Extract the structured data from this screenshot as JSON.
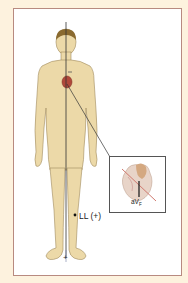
{
  "figure": {
    "lead_label": "LL (+)",
    "positive_pole": "+",
    "negative_pole_mark": "−",
    "inset": {
      "lead_name": "aV",
      "lead_subscript": "F"
    }
  },
  "colors": {
    "background": "#fdf2de",
    "frame_border": "#b88a80",
    "skin": "#ecd9a8",
    "skin_outline": "#a08a5c",
    "hair": "#8a6a30",
    "heart": "#b0483a",
    "axis_line": "#333333",
    "lead_line_pink": "#d07a70"
  }
}
